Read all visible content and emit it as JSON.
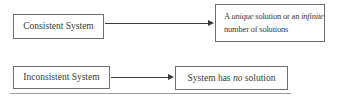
{
  "diagram": {
    "row1": {
      "left_box": {
        "label": "Consistent System"
      },
      "right_box": {
        "line1_pre": "A ",
        "line1_italic1": "unique",
        "line1_mid": " solution or an ",
        "line1_italic2": "infinite",
        "line2": "number of solutions"
      }
    },
    "row2": {
      "left_box": {
        "label": "Inconsistent System"
      },
      "right_box": {
        "pre": "System has ",
        "italic": "no",
        "post": " solution"
      }
    },
    "colors": {
      "background": "#ffffff",
      "border": "#6e6e6e",
      "text": "#3a3a3a",
      "arrow": "#3a3a3a",
      "rule": "#9a9a9a"
    }
  }
}
